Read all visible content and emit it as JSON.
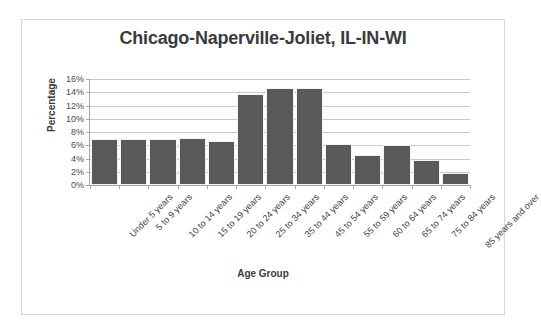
{
  "chart_data": {
    "type": "bar",
    "title": "Chicago-Naperville-Joliet, IL-IN-WI",
    "xlabel": "Age Group",
    "ylabel": "Percentage",
    "categories": [
      "Under 5 years",
      "5 to 9 years",
      "10 to 14 years",
      "15 to 19 years",
      "20 to 24 years",
      "25 to 34 years",
      "35 to 44 years",
      "45 to 54 years",
      "55 to 59 years",
      "60 to 64 years",
      "65 to 74 years",
      "75 to 84 years",
      "85 years and over"
    ],
    "values": [
      7.0,
      7.0,
      7.0,
      7.1,
      6.7,
      13.8,
      14.7,
      14.6,
      6.2,
      4.5,
      6.0,
      3.8,
      1.8
    ],
    "ylim": [
      0,
      16
    ],
    "ytick_step": 2,
    "ytick_labels": [
      "0%",
      "2%",
      "4%",
      "6%",
      "8%",
      "10%",
      "12%",
      "14%",
      "16%"
    ],
    "grid": true,
    "legend": false,
    "bar_color": "#595959",
    "gridline_color": "#c9c9c9",
    "axis_color": "#a6a6a6",
    "title_color": "#3b3b3b",
    "border_color": "#d8d8d8"
  }
}
